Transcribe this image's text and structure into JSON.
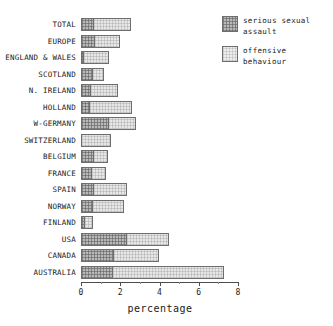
{
  "chart_data": {
    "type": "bar",
    "orientation": "horizontal",
    "stacked": true,
    "title": "",
    "xlabel": "percentage",
    "ylabel": "",
    "xlim": [
      0,
      8
    ],
    "xticks": [
      0,
      2,
      4,
      6,
      8
    ],
    "xtick_labels": [
      "0",
      "2",
      "4",
      "6",
      "8"
    ],
    "minor_ticks": [
      1,
      3,
      5,
      7
    ],
    "grid": false,
    "legend_position": "top-right",
    "categories": [
      "TOTAL",
      "EUROPE",
      "ENGLAND & WALES",
      "SCOTLAND",
      "N. IRELAND",
      "HOLLAND",
      "W-GERMANY",
      "SWITZERLAND",
      "BELGIUM",
      "FRANCE",
      "SPAIN",
      "NORWAY",
      "FINLAND",
      "USA",
      "CANADA",
      "AUSTRALIA"
    ],
    "series": [
      {
        "name": "serious sexual assault",
        "fill": "dark-hatch",
        "values": [
          0.6,
          0.65,
          0.05,
          0.55,
          0.45,
          0.4,
          1.4,
          0.0,
          0.6,
          0.5,
          0.6,
          0.55,
          0.15,
          2.3,
          1.65,
          1.6
        ]
      },
      {
        "name": "offensive behaviour",
        "fill": "light-hatch",
        "values": [
          1.95,
          1.35,
          1.35,
          0.6,
          1.45,
          2.2,
          1.4,
          1.55,
          0.8,
          0.75,
          1.75,
          1.65,
          0.45,
          2.2,
          2.3,
          5.7
        ]
      }
    ],
    "totals": [
      2.55,
      2.0,
      1.4,
      1.15,
      1.9,
      2.6,
      2.8,
      1.55,
      1.4,
      1.25,
      2.35,
      2.2,
      0.6,
      4.5,
      3.95,
      7.3
    ]
  },
  "legend": {
    "entries": [
      {
        "label": "serious sexual\nassault",
        "swatch": "dark-hatch"
      },
      {
        "label": "offensive\nbehaviour",
        "swatch": "light-hatch"
      }
    ]
  },
  "axis": {
    "x_title": "percentage"
  },
  "colors": {
    "dark_fill": "#b9b9b9",
    "light_fill": "#e7e7e7",
    "outline": "#6e6e6e",
    "text": "#1a1a1a",
    "background": "#ffffff"
  }
}
